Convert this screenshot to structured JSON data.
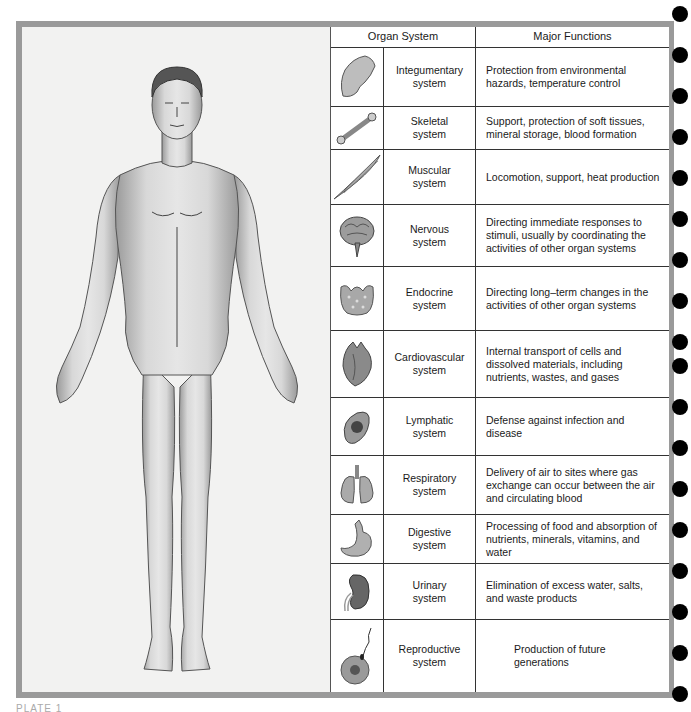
{
  "table": {
    "headers": {
      "organ_system": "Organ System",
      "major_functions": "Major Functions"
    },
    "rows": [
      {
        "icon": "hand-icon",
        "name_line1": "Integumentary",
        "name_line2": "system",
        "function": "Protection from environmental hazards, temperature control"
      },
      {
        "icon": "bone-icon",
        "name_line1": "Skeletal",
        "name_line2": "system",
        "function": "Support, protection of soft tissues, mineral storage, blood formation"
      },
      {
        "icon": "muscle-icon",
        "name_line1": "Muscular",
        "name_line2": "system",
        "function": "Locomotion, support, heat production"
      },
      {
        "icon": "brain-icon",
        "name_line1": "Nervous",
        "name_line2": "system",
        "function": "Directing immediate responses to stimuli, usually by coordinating the activities of other organ systems"
      },
      {
        "icon": "thyroid-icon",
        "name_line1": "Endocrine",
        "name_line2": "system",
        "function": "Directing long–term changes in the activities of other organ systems"
      },
      {
        "icon": "heart-icon",
        "name_line1": "Cardiovascular",
        "name_line2": "system",
        "function": "Internal transport of cells and dissolved materials, including nutrients, wastes, and gases"
      },
      {
        "icon": "spleen-icon",
        "name_line1": "Lymphatic",
        "name_line2": "system",
        "function": "Defense against infection and disease"
      },
      {
        "icon": "lungs-icon",
        "name_line1": "Respiratory",
        "name_line2": "system",
        "function": "Delivery of air to sites where gas exchange can occur between the air and circulating blood"
      },
      {
        "icon": "stomach-icon",
        "name_line1": "Digestive",
        "name_line2": "system",
        "function": "Processing of food and absorption of nutrients, minerals, vitamins, and water"
      },
      {
        "icon": "kidney-icon",
        "name_line1": "Urinary",
        "name_line2": "system",
        "function": "Elimination of excess water, salts, and waste products"
      },
      {
        "icon": "ovum-sperm-icon",
        "name_line1": "Reproductive",
        "name_line2": "system",
        "function": "Production of future generations"
      }
    ]
  },
  "plate_label": "PLATE 1"
}
